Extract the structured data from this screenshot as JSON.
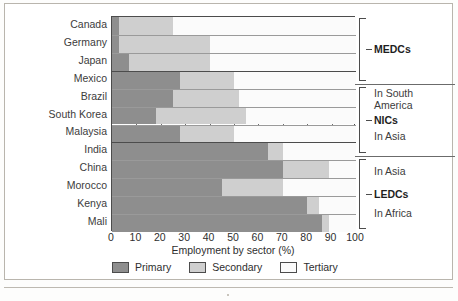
{
  "chart_data": {
    "type": "bar",
    "orientation": "horizontal",
    "stacked": true,
    "title": "",
    "xlabel": "Employment by sector (%)",
    "ylabel": "",
    "xlim": [
      0,
      100
    ],
    "xticks": [
      0,
      10,
      20,
      30,
      40,
      50,
      60,
      70,
      80,
      90,
      100
    ],
    "grid": true,
    "legend_position": "bottom",
    "categories": [
      "Canada",
      "Germany",
      "Japan",
      "Mexico",
      "Brazil",
      "South Korea",
      "Malaysia",
      "India",
      "China",
      "Morocco",
      "Kenya",
      "Mali"
    ],
    "series": [
      {
        "name": "Primary",
        "color": "#8e8e8e",
        "values": [
          3,
          3,
          7,
          28,
          25,
          18,
          28,
          64,
          70,
          45,
          80,
          86
        ]
      },
      {
        "name": "Secondary",
        "color": "#cfcfcf",
        "values": [
          22,
          37,
          33,
          22,
          27,
          37,
          22,
          6,
          19,
          25,
          5,
          3
        ]
      },
      {
        "name": "Tertiary",
        "color": "#fbfbfb",
        "values": [
          75,
          60,
          60,
          50,
          48,
          45,
          50,
          30,
          11,
          30,
          15,
          11
        ]
      }
    ],
    "groups": [
      {
        "name": "MEDCs",
        "categories": [
          "Canada",
          "Germany",
          "Japan"
        ],
        "notes": []
      },
      {
        "name": "NICs",
        "categories": [
          "Mexico",
          "Brazil",
          "South Korea",
          "Malaysia"
        ],
        "notes": [
          "In South",
          "America",
          "In Asia"
        ]
      },
      {
        "name": "LEDCs",
        "categories": [
          "India",
          "China",
          "Morocco",
          "Kenya",
          "Mali"
        ],
        "notes": [
          "In Asia",
          "In Africa"
        ]
      }
    ]
  },
  "axis": {
    "x_title": "Employment by sector (%)",
    "x_tick_labels": [
      "0",
      "10",
      "20",
      "30",
      "40",
      "50",
      "60",
      "70",
      "80",
      "90",
      "100"
    ]
  },
  "categories": [
    {
      "label": "Canada"
    },
    {
      "label": "Germany"
    },
    {
      "label": "Japan"
    },
    {
      "label": "Mexico"
    },
    {
      "label": "Brazil"
    },
    {
      "label": "South Korea"
    },
    {
      "label": "Malaysia"
    },
    {
      "label": "India"
    },
    {
      "label": "China"
    },
    {
      "label": "Morocco"
    },
    {
      "label": "Kenya"
    },
    {
      "label": "Mali"
    }
  ],
  "annotations": {
    "medcs_title": "MEDCs",
    "nics_title": "NICs",
    "nics_note_line1": "In South",
    "nics_note_line2": "America",
    "nics_note_line3": "In Asia",
    "ledcs_title": "LEDCs",
    "ledcs_note_line1": "In Asia",
    "ledcs_note_line2": "In Africa"
  },
  "legend": {
    "items": [
      {
        "label": "Primary",
        "color": "#8e8e8e"
      },
      {
        "label": "Secondary",
        "color": "#cfcfcf"
      },
      {
        "label": "Tertiary",
        "color": "#fbfbfb"
      }
    ]
  },
  "colors": {
    "primary": "#8e8e8e",
    "secondary": "#cfcfcf",
    "tertiary": "#fbfbfb",
    "axis": "#4c4c4c",
    "grid": "#6e6e6e",
    "frame": "#b9b5ad"
  }
}
